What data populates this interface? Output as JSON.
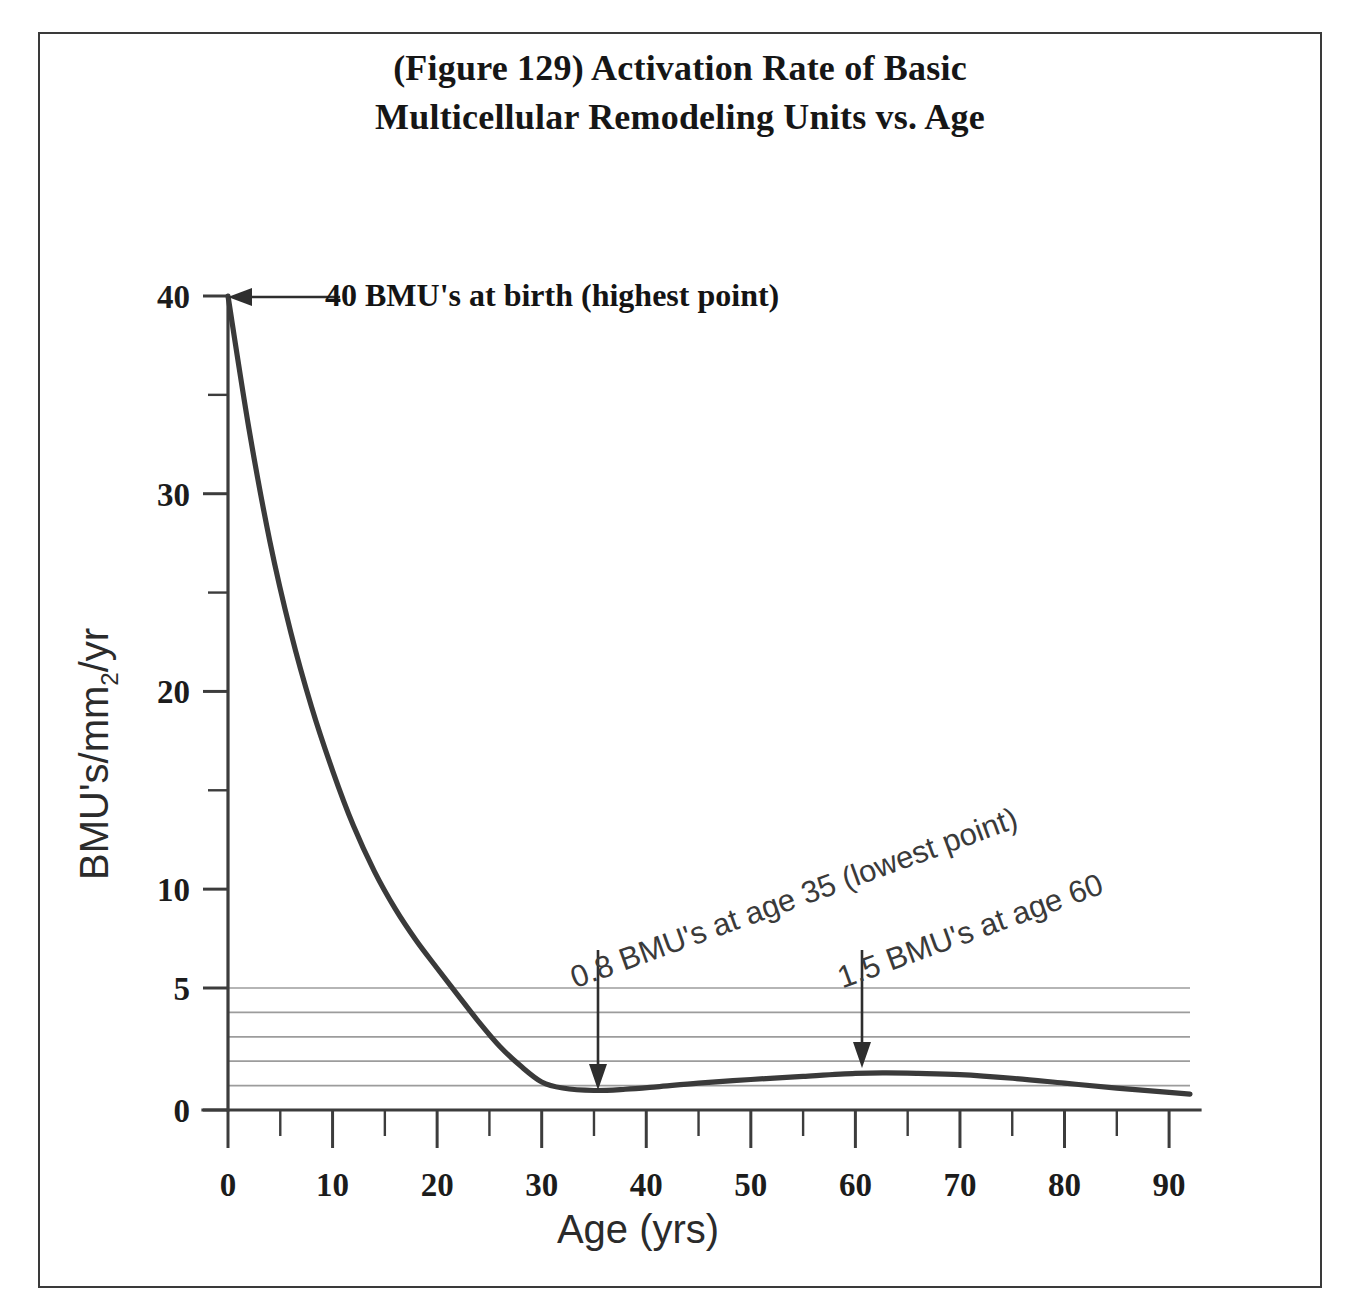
{
  "figure": {
    "title_line1": "(Figure 129) Activation Rate of Basic",
    "title_line2": "Multicellular Remodeling Units vs. Age"
  },
  "chart_data": {
    "type": "line",
    "title": "(Figure 129) Activation Rate of Basic Multicellular Remodeling Units vs. Age",
    "xlabel": "Age (yrs)",
    "ylabel": "BMU's/mm2/yr",
    "ylabel_base": "BMU's/mm",
    "ylabel_sub": "2",
    "ylabel_tail": "/yr",
    "xlim": [
      0,
      92
    ],
    "ylim": [
      0,
      41
    ],
    "grid": "horizontal-minor-lower-band",
    "legend": "none",
    "x_major_ticks": [
      0,
      10,
      20,
      30,
      40,
      50,
      60,
      70,
      80,
      90
    ],
    "x_minor_ticks": [
      5,
      15,
      25,
      35,
      45,
      55,
      65,
      75,
      85
    ],
    "x_tick_labels": [
      "0",
      "10",
      "20",
      "30",
      "40",
      "50",
      "60",
      "70",
      "80",
      "90"
    ],
    "y_major_ticks": [
      0,
      5,
      10,
      20,
      30,
      40
    ],
    "y_minor_ticks": [
      15,
      25,
      35
    ],
    "y_tick_labels": [
      "0",
      "5",
      "10",
      "20",
      "30",
      "40"
    ],
    "gridline_values": [
      1,
      2,
      3,
      4,
      5
    ],
    "series": [
      {
        "name": "BMU activation rate",
        "x": [
          0,
          2,
          4,
          6,
          8,
          10,
          12,
          14,
          16,
          18,
          20,
          22,
          24,
          26,
          28,
          30,
          32,
          35,
          38,
          41,
          45,
          50,
          55,
          60,
          63,
          66,
          70,
          75,
          80,
          85,
          90,
          92
        ],
        "y": [
          40.0,
          33.3,
          27.6,
          23.0,
          19.2,
          16.0,
          13.2,
          10.9,
          9.0,
          7.4,
          6.0,
          4.7,
          3.6,
          2.6,
          1.8,
          1.15,
          0.9,
          0.8,
          0.85,
          0.95,
          1.1,
          1.25,
          1.38,
          1.5,
          1.52,
          1.5,
          1.45,
          1.3,
          1.1,
          0.9,
          0.72,
          0.65
        ]
      }
    ],
    "annotations": [
      {
        "id": "birth-callout",
        "text": "40 BMU's at birth (highest point)",
        "points_to_x": 0,
        "points_to_y": 40,
        "arrow_direction": "left"
      },
      {
        "id": "lowest-callout",
        "text": "0.8 BMU's at age 35 (lowest point)",
        "points_to_x": 35,
        "points_to_y": 0.8,
        "arrow_direction": "down"
      },
      {
        "id": "age60-callout",
        "text": "1.5 BMU's at age 60",
        "points_to_x": 60,
        "points_to_y": 1.5,
        "arrow_direction": "down"
      }
    ],
    "colors": {
      "curve": "#3a3a3a",
      "axis": "#3c3c3c",
      "gridline": "#9c9c9c",
      "text": "#1c1c1c",
      "frame": "#3a3a3a",
      "background": "#ffffff"
    }
  }
}
